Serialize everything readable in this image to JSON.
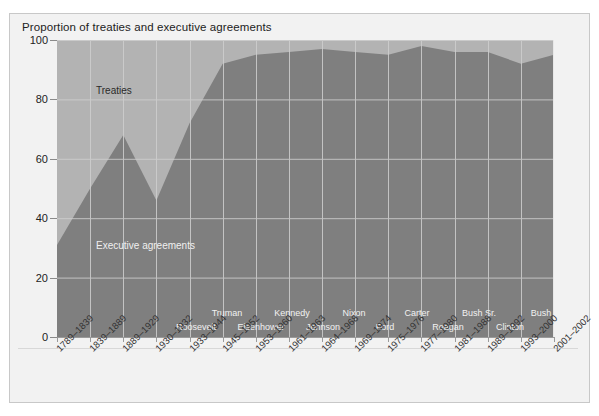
{
  "chart_data": {
    "type": "area",
    "title": "Proportion of treaties and executive agreements",
    "xlabel": "",
    "ylabel": "",
    "ylim": [
      0,
      100
    ],
    "yticks": [
      0,
      20,
      40,
      60,
      80,
      100
    ],
    "grid": true,
    "stacked": true,
    "legend_position": "inline-annotations",
    "categories": [
      "1789–1839",
      "1839–1889",
      "1889–1929",
      "1930–1932",
      "1933–1944",
      "1945–1952",
      "1953–1960",
      "1961–1963",
      "1964–1968",
      "1969–1974",
      "1975–1976",
      "1977–1980",
      "1981–1988",
      "1989–1992",
      "1993–2000",
      "2001–2002"
    ],
    "series": [
      {
        "name": "Executive agreements",
        "color": "#7f7f7f",
        "values": [
          31,
          50,
          68,
          46,
          72,
          92,
          95,
          96,
          97,
          96,
          95,
          98,
          96,
          96,
          92,
          95
        ]
      },
      {
        "name": "Treaties",
        "color": "#b3b3b3",
        "values": [
          69,
          50,
          32,
          54,
          28,
          8,
          5,
          4,
          3,
          4,
          5,
          2,
          4,
          4,
          8,
          5
        ]
      }
    ],
    "annotations": [
      {
        "name": "Treaties",
        "text": "Treaties"
      },
      {
        "name": "Executive agreements",
        "text": "Executive agreements"
      }
    ],
    "presidents": [
      {
        "label": "Roosevelt",
        "row": 1,
        "category_index": 4
      },
      {
        "label": "Truman",
        "row": 0,
        "category_index": 5
      },
      {
        "label": "Eisenhower",
        "row": 1,
        "category_index": 6
      },
      {
        "label": "Kennedy",
        "row": 0,
        "category_index": 7
      },
      {
        "label": "Johnson",
        "row": 1,
        "category_index": 8
      },
      {
        "label": "Nixon",
        "row": 0,
        "category_index": 9
      },
      {
        "label": "Ford",
        "row": 1,
        "category_index": 10
      },
      {
        "label": "Carter",
        "row": 0,
        "category_index": 11
      },
      {
        "label": "Reagan",
        "row": 1,
        "category_index": 12
      },
      {
        "label": "Bush Sr.",
        "row": 0,
        "category_index": 13
      },
      {
        "label": "Clinton",
        "row": 1,
        "category_index": 14
      },
      {
        "label": "Bush",
        "row": 0,
        "category_index": 15
      }
    ]
  },
  "colors": {
    "panel_background": "#f2f2f2",
    "panel_border": "#c8c8c8",
    "treaties_fill": "#b3b3b3",
    "executive_fill": "#7f7f7f",
    "gridline": "#cfcfcf",
    "axis": "#9a9a9a",
    "text": "#222222",
    "text_on_fill": "#f0f0f0"
  },
  "yticks": {
    "t0": "0",
    "t20": "20",
    "t40": "40",
    "t60": "60",
    "t80": "80",
    "t100": "100"
  },
  "xticks": {
    "x0": "1789–1839",
    "x1": "1839–1889",
    "x2": "1889–1929",
    "x3": "1930–1932",
    "x4": "1933–1944",
    "x5": "1945–1952",
    "x6": "1953–1960",
    "x7": "1961–1963",
    "x8": "1964–1968",
    "x9": "1969–1974",
    "x10": "1975–1976",
    "x11": "1977–1980",
    "x12": "1981–1988",
    "x13": "1989–1992",
    "x14": "1993–2000",
    "x15": "2001–2002"
  },
  "presidents": {
    "p0": "Roosevelt",
    "p1": "Truman",
    "p2": "Eisenhower",
    "p3": "Kennedy",
    "p4": "Johnson",
    "p5": "Nixon",
    "p6": "Ford",
    "p7": "Carter",
    "p8": "Reagan",
    "p9": "Bush Sr.",
    "p10": "Clinton",
    "p11": "Bush"
  },
  "annotations": {
    "treaties": "Treaties",
    "executive_agreements": "Executive agreements"
  }
}
